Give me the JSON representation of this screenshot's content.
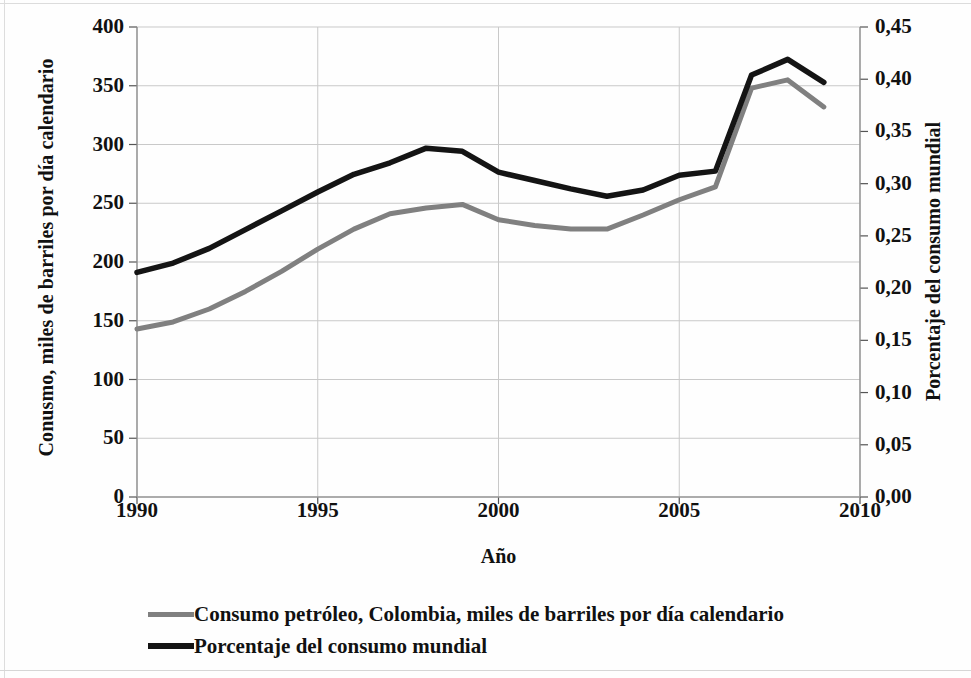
{
  "chart_data": {
    "type": "line",
    "title": "",
    "xlabel": "Año",
    "ylabel": "Conusmo, miles de barriles por día calendario",
    "y2label": "Porcentaje del consumo mundial",
    "x": [
      1990,
      1991,
      1992,
      1993,
      1994,
      1995,
      1996,
      1997,
      1998,
      1999,
      2000,
      2001,
      2002,
      2003,
      2004,
      2005,
      2006,
      2007,
      2008,
      2009
    ],
    "xlim": [
      1990,
      2010
    ],
    "ylim": [
      0,
      400
    ],
    "y2lim": [
      0.0,
      0.45
    ],
    "xticks": [
      "1990",
      "1995",
      "2000",
      "2005",
      "2010"
    ],
    "xtick_values": [
      1990,
      1995,
      2000,
      2005,
      2010
    ],
    "yticks": [
      "0",
      "50",
      "100",
      "150",
      "200",
      "250",
      "300",
      "350",
      "400"
    ],
    "ytick_values": [
      0,
      50,
      100,
      150,
      200,
      250,
      300,
      350,
      400
    ],
    "y2ticks": [
      "0,00",
      "0,05",
      "0,10",
      "0,15",
      "0,20",
      "0,25",
      "0,30",
      "0,35",
      "0,40",
      "0,45"
    ],
    "y2tick_values": [
      0.0,
      0.05,
      0.1,
      0.15,
      0.2,
      0.25,
      0.3,
      0.35,
      0.4,
      0.45
    ],
    "grid": true,
    "grid_axis": "both",
    "legend_position": "bottom-left",
    "series": [
      {
        "name": "Consumo petróleo, Colombia, miles de barriles por día calendario",
        "axis": "left",
        "color": "#808080",
        "values": [
          143,
          149,
          160,
          175,
          192,
          211,
          228,
          241,
          246,
          249,
          236,
          231,
          228,
          228,
          240,
          253,
          264,
          348,
          355,
          332
        ]
      },
      {
        "name": "Porcentaje del consumo mundial",
        "axis": "right",
        "color": "#141414",
        "values": [
          0.215,
          0.224,
          0.238,
          0.256,
          0.274,
          0.292,
          0.309,
          0.32,
          0.334,
          0.331,
          0.311,
          0.303,
          0.295,
          0.288,
          0.294,
          0.308,
          0.312,
          0.404,
          0.419,
          0.397
        ]
      }
    ]
  },
  "axes": {
    "y_left_title": "Conusmo, miles de barriles por día calendario",
    "y_right_title": "Porcentaje del consumo mundial",
    "x_title": "Año"
  },
  "legend": {
    "items": [
      {
        "label": "Consumo petróleo, Colombia, miles de barriles por día calendario",
        "color": "#808080"
      },
      {
        "label": "Porcentaje del consumo mundial",
        "color": "#141414"
      }
    ]
  }
}
